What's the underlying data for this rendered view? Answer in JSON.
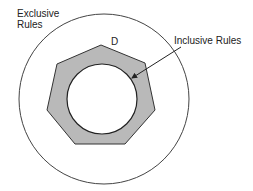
{
  "diagram": {
    "labels": {
      "exclusive_line1": "Exclusive",
      "exclusive_line2": "Rules",
      "inclusive": "Inclusive Rules",
      "domain": "D"
    },
    "colors": {
      "stroke": "#333333",
      "band_fill": "#b9b9b9",
      "background": "#ffffff"
    },
    "shapes": {
      "outer_circle": {
        "cx": 104,
        "cy": 99,
        "r": 85
      },
      "heptagon_points": "101,45 145,63 155,110 125,144 75,144 47,110 57,64",
      "inner_circle": {
        "cx": 102,
        "cy": 99,
        "r": 35
      },
      "arrow": {
        "x1": 181,
        "y1": 47,
        "x2": 132,
        "y2": 78
      }
    }
  }
}
